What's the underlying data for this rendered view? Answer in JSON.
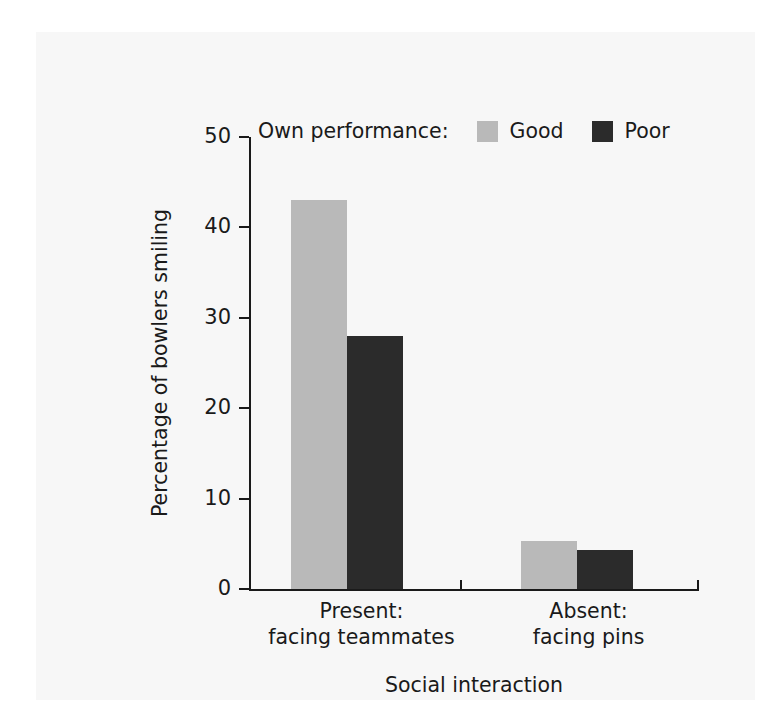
{
  "legend": {
    "title": "Own performance:",
    "entries": [
      {
        "label": "Good",
        "color": "#b9b9b9",
        "swatch_name": "legend-swatch-good"
      },
      {
        "label": "Poor",
        "color": "#2b2b2b",
        "swatch_name": "legend-swatch-poor"
      }
    ]
  },
  "axes": {
    "y_title": "Percentage of bowlers smiling",
    "x_title": "Social interaction",
    "y_ticks": [
      "0",
      "10",
      "20",
      "30",
      "40",
      "50"
    ]
  },
  "categories": [
    {
      "line1": "Present:",
      "line2": "facing teammates"
    },
    {
      "line1": "Absent:",
      "line2": "facing pins"
    }
  ],
  "chart_data": {
    "type": "bar",
    "title": "",
    "xlabel": "Social interaction",
    "ylabel": "Percentage of bowlers smiling",
    "categories": [
      "Present: facing teammates",
      "Absent: facing pins"
    ],
    "series": [
      {
        "name": "Good",
        "color": "#b9b9b9",
        "values": [
          43,
          5.3
        ]
      },
      {
        "name": "Poor",
        "color": "#2b2b2b",
        "values": [
          28,
          4.3
        ]
      }
    ],
    "ylim": [
      0,
      50
    ],
    "yticks": [
      0,
      10,
      20,
      30,
      40,
      50
    ],
    "grid": false,
    "legend_position": "top",
    "legend_title": "Own performance:"
  }
}
